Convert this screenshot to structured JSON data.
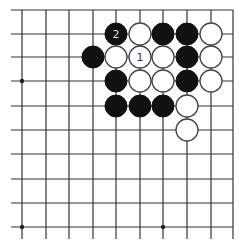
{
  "diagram": {
    "type": "go-board-fragment",
    "columns": 10,
    "rows": 10,
    "edges": {
      "top": true,
      "right": true,
      "left": false,
      "bottom": false
    },
    "col_x": [
      22,
      46,
      69,
      93,
      116,
      140,
      163,
      187,
      211,
      233
    ],
    "row_y": [
      10,
      34,
      57,
      81,
      106,
      130,
      154,
      179,
      203,
      227
    ],
    "star_points": [
      {
        "col": 0,
        "row": 3
      },
      {
        "col": 0,
        "row": 9
      },
      {
        "col": 6,
        "row": 9
      }
    ],
    "stones": [
      {
        "color": "black",
        "col": 4,
        "row": 1,
        "label": "2"
      },
      {
        "color": "white",
        "col": 5,
        "row": 1,
        "label": ""
      },
      {
        "color": "black",
        "col": 6,
        "row": 1,
        "label": ""
      },
      {
        "color": "black",
        "col": 7,
        "row": 1,
        "label": ""
      },
      {
        "color": "white",
        "col": 8,
        "row": 1,
        "label": ""
      },
      {
        "color": "black",
        "col": 3,
        "row": 2,
        "label": ""
      },
      {
        "color": "white",
        "col": 4,
        "row": 2,
        "label": ""
      },
      {
        "color": "white",
        "col": 5,
        "row": 2,
        "label": "1"
      },
      {
        "color": "white",
        "col": 6,
        "row": 2,
        "label": ""
      },
      {
        "color": "black",
        "col": 7,
        "row": 2,
        "label": ""
      },
      {
        "color": "white",
        "col": 8,
        "row": 2,
        "label": ""
      },
      {
        "color": "black",
        "col": 4,
        "row": 3,
        "label": ""
      },
      {
        "color": "white",
        "col": 5,
        "row": 3,
        "label": ""
      },
      {
        "color": "white",
        "col": 6,
        "row": 3,
        "label": ""
      },
      {
        "color": "black",
        "col": 7,
        "row": 3,
        "label": ""
      },
      {
        "color": "white",
        "col": 8,
        "row": 3,
        "label": ""
      },
      {
        "color": "black",
        "col": 4,
        "row": 4,
        "label": ""
      },
      {
        "color": "black",
        "col": 5,
        "row": 4,
        "label": ""
      },
      {
        "color": "black",
        "col": 6,
        "row": 4,
        "label": ""
      },
      {
        "color": "white",
        "col": 7,
        "row": 4,
        "label": ""
      },
      {
        "color": "white",
        "col": 7,
        "row": 5,
        "label": ""
      }
    ],
    "colors": {
      "black_stone": "#111111",
      "white_stone": "#ffffff",
      "line": "#333333",
      "background": "#ffffff"
    }
  }
}
